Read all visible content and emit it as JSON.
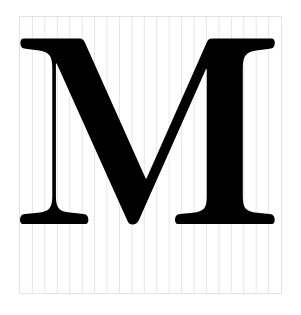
{
  "document": {
    "type": "glyph-specimen",
    "title": "Letter M specimen on ruled grid",
    "background_color": "#ffffff"
  },
  "frame": {
    "name": "ruled-grid-frame",
    "border_color": "#e3e3e3",
    "fill_color": "#ffffff",
    "x": 19,
    "y": 16,
    "width": 263,
    "height": 278,
    "grid": {
      "orientation": "vertical",
      "line_color": "#e6e6e6",
      "line_count": 20,
      "line_spacing_px": 12.52,
      "line_width_px": 1
    }
  },
  "glyph": {
    "name": "letter-m",
    "character": "M",
    "case": "uppercase",
    "style": "serif",
    "color": "#000000",
    "cap_height_top_y": 38,
    "baseline_y": 222,
    "left_edge_x": 20,
    "right_edge_x": 276
  }
}
